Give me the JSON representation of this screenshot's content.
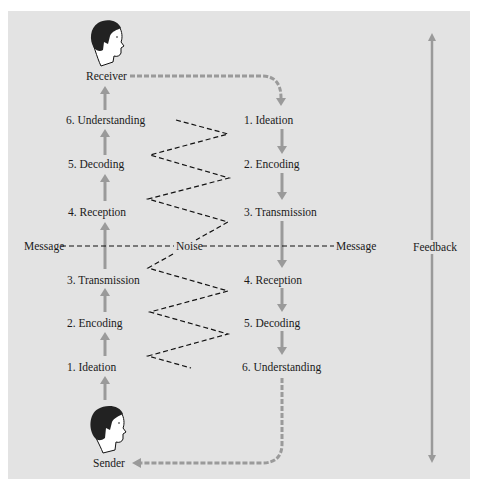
{
  "diagram": {
    "colors": {
      "panel_bg": "#e3e3e3",
      "arrow_gray": "#9a9a9a",
      "text": "#1a1a1a",
      "noise_line": "#111111"
    },
    "receiver_label": "Receiver",
    "sender_label": "Sender",
    "feedback_label": "Feedback",
    "message_left_label": "Message",
    "message_right_label": "Message",
    "noise_label": "Noise",
    "left_column": [
      {
        "step": "6. Understanding"
      },
      {
        "step": "5. Decoding"
      },
      {
        "step": "4. Reception"
      },
      {
        "step": "3. Transmission"
      },
      {
        "step": "2. Encoding"
      },
      {
        "step": "1. Ideation"
      }
    ],
    "right_column": [
      {
        "step": "1. Ideation"
      },
      {
        "step": "2. Encoding"
      },
      {
        "step": "3. Transmission"
      },
      {
        "step": "4. Reception"
      },
      {
        "step": "5. Decoding"
      },
      {
        "step": "6. Understanding"
      }
    ],
    "icons": {
      "receiver": "person-head-icon",
      "sender": "person-head-icon"
    }
  }
}
